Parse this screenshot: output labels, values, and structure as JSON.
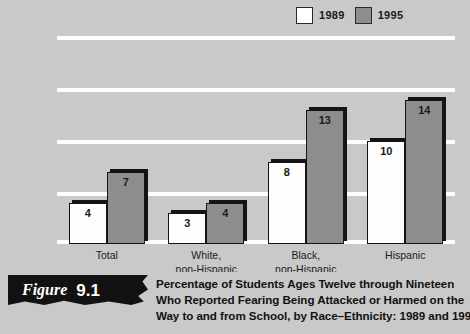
{
  "chart_data": {
    "type": "bar",
    "xlabel": "",
    "ylabel": "",
    "ylim": [
      0,
      20
    ],
    "yticks": [
      0,
      5,
      10,
      15,
      20
    ],
    "grid": true,
    "legend_position": "top-right",
    "categories": [
      "Total",
      "White,\nnon-Hispanic",
      "Black,\nnon-Hispanic",
      "Hispanic"
    ],
    "series": [
      {
        "name": "1989",
        "color": "#ffffff",
        "values": [
          4,
          3,
          8,
          10
        ]
      },
      {
        "name": "1995",
        "color": "#8d8d8d",
        "values": [
          7,
          4,
          13,
          14
        ]
      }
    ]
  },
  "legend": {
    "items": [
      {
        "label": "1989",
        "swatch": "white-swatch"
      },
      {
        "label": "1995",
        "swatch": "gray-swatch"
      }
    ]
  },
  "axis": {
    "yticks": [
      "20",
      "15",
      "10",
      "5",
      "0"
    ]
  },
  "groups": [
    {
      "line1": "Total",
      "line2": "",
      "v1989": "4",
      "v1995": "7"
    },
    {
      "line1": "White,",
      "line2": "non-Hispanic",
      "v1989": "3",
      "v1995": "4"
    },
    {
      "line1": "Black,",
      "line2": "non-Hispanic",
      "v1989": "8",
      "v1995": "13"
    },
    {
      "line1": "Hispanic",
      "line2": "",
      "v1989": "10",
      "v1995": "14"
    }
  ],
  "caption": {
    "figure_word": "Figure",
    "figure_number": "9.1",
    "line1": "Percentage of Students Ages Twelve through Nineteen",
    "line2": "Who Reported Fearing Being Attacked or Harmed on the",
    "line3": "Way to and from School, by Race–Ethnicity: 1989 and 1995"
  }
}
